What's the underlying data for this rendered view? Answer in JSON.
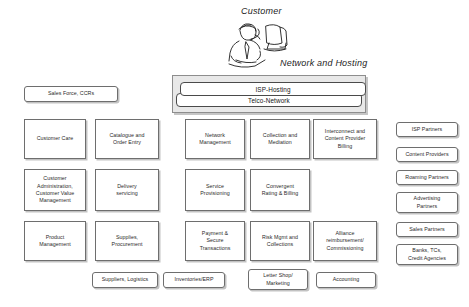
{
  "diagram": {
    "title_labels": {
      "customer": "Customer",
      "network_and_hosting": "Network and Hosting"
    },
    "icons": {
      "customer_at_computer": "person-at-computer-icon"
    },
    "network_stack": [
      {
        "label": "ISP-Hosting"
      },
      {
        "label": "Telco-Network"
      }
    ],
    "left_column": [
      {
        "label": "Sales Force, CCRs"
      },
      {
        "label": "Customer Care"
      },
      {
        "label": "Customer\nAdministration,\nCustomer Value\nManagement"
      },
      {
        "label": "Product\nManagement"
      }
    ],
    "second_column": [
      {
        "label": "Catalogue and\nOrder Entry"
      },
      {
        "label": "Delivery\nservicing"
      },
      {
        "label": "Supplies,\nProcurement"
      }
    ],
    "third_column": [
      {
        "label": "Network\nManagement"
      },
      {
        "label": "Service\nProvisioning"
      },
      {
        "label": "Payment &\nSecure\nTransactions"
      }
    ],
    "fourth_column": [
      {
        "label": "Collection and\nMediation"
      },
      {
        "label": "Convergent\nRating & Billing"
      },
      {
        "label": "Risk Mgmt and\nCollections"
      }
    ],
    "fifth_column": [
      {
        "label": "Interconnect and\nContent Provider\nBilling"
      },
      {
        "label": "Alliance\nreimbursement/\nCommissioning"
      }
    ],
    "right_column": [
      {
        "label": "ISP Partners"
      },
      {
        "label": "Content Providers"
      },
      {
        "label": "Roaming Partners"
      },
      {
        "label": "Advertising\nPartners"
      },
      {
        "label": "Sales Partners"
      },
      {
        "label": "Banks, TCs,\nCredit Agencies"
      }
    ],
    "bottom_row": [
      {
        "label": "Suppliers, Logistics"
      },
      {
        "label": "Inventories/ERP"
      },
      {
        "label": "Letter Shop/\nMarketing"
      },
      {
        "label": "Accounting"
      }
    ],
    "colors": {
      "box_border": "#6e6e6e",
      "group_fill": "#e8e8e8",
      "group_border": "#8d8d8d",
      "text": "#2a2a2a"
    }
  }
}
